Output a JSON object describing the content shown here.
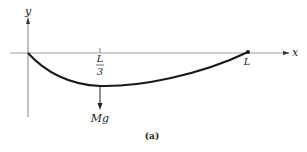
{
  "diagram": {
    "axes": {
      "x_label": "x",
      "y_label": "y"
    },
    "labels": {
      "third_numerator": "L",
      "third_denominator": "3",
      "end": "L",
      "force": "Mg",
      "caption": "(a)"
    },
    "colors": {
      "stroke": "#222222",
      "axis": "#555555",
      "background": "#ffffff"
    }
  }
}
